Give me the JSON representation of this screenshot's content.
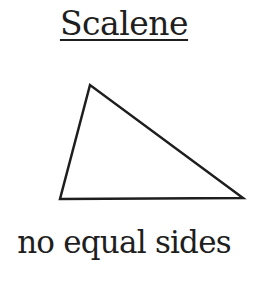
{
  "title": "Scalene",
  "caption": "no equal sides",
  "triangle": {
    "vertices": [
      [
        90,
        85
      ],
      [
        60,
        199
      ],
      [
        243,
        198
      ]
    ],
    "stroke": "#1e1e1e",
    "fill": "#ffffff"
  }
}
